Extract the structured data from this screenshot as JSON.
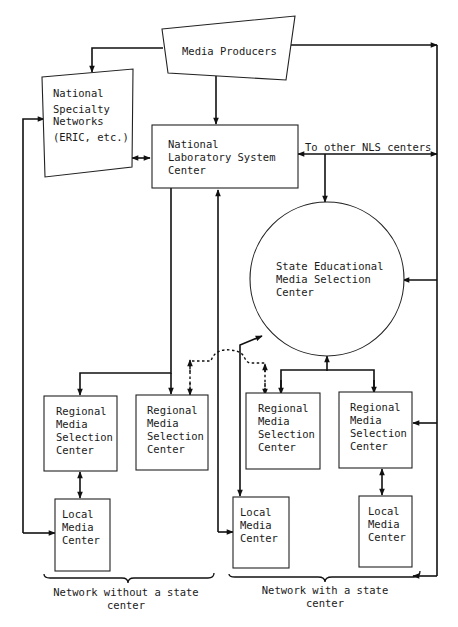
{
  "diagram": {
    "nodes": {
      "media_producers": {
        "label": "Media Producers"
      },
      "national_specialty": {
        "lines": [
          "National",
          "Specialty",
          "Networks",
          "(ERIC, etc.)"
        ]
      },
      "nls_center": {
        "lines": [
          "National",
          "Laboratory System",
          "Center"
        ]
      },
      "state_center": {
        "lines": [
          "State Educational",
          "Media Selection",
          "Center"
        ]
      },
      "regional_1": {
        "lines": [
          "Regional",
          "Media",
          "Selection",
          "Center"
        ]
      },
      "regional_2": {
        "lines": [
          "Regional",
          "Media",
          "Selection",
          "Center"
        ]
      },
      "regional_3": {
        "lines": [
          "Regional",
          "Media",
          "Selection",
          "Center"
        ]
      },
      "regional_4": {
        "lines": [
          "Regional",
          "Media",
          "Selection",
          "Center"
        ]
      },
      "local_1": {
        "lines": [
          "Local",
          "Media",
          "Center"
        ]
      },
      "local_2": {
        "lines": [
          "Local",
          "Media",
          "Center"
        ]
      },
      "local_3": {
        "lines": [
          "Local",
          "Media",
          "Center"
        ]
      }
    },
    "edge_labels": {
      "other_nls": "To other NLS centers"
    },
    "groups": {
      "without_state": {
        "lines": [
          "Network without a state",
          "center"
        ]
      },
      "with_state": {
        "lines": [
          "Network with a state",
          "center"
        ]
      }
    }
  }
}
